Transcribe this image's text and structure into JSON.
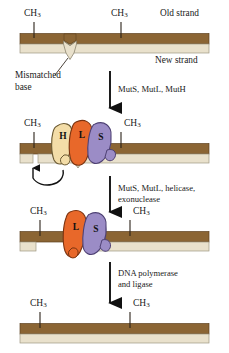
{
  "figure": {
    "methyl_label": "CH",
    "methyl_sub": "3"
  },
  "colors": {
    "old_strand": "#8B6534",
    "old_strand_dark": "#6E4B22",
    "new_strand": "#E9E1CC",
    "new_strand_edge": "#BBB49C",
    "mutH": "#F3DDA8",
    "mutL": "#E8682A",
    "mutS": "#9B8CC6",
    "outline": "#3A2E1E",
    "arrow": "#111111",
    "text": "#1A1A1A"
  },
  "panels": [
    {
      "id": "panel-1-mismatch",
      "methyl_marks": 2,
      "annotations": {
        "old_strand": "Old strand",
        "new_strand": "New strand",
        "mismatch_line1": "Mismatched",
        "mismatch_line2": "base"
      }
    },
    {
      "id": "panel-2-recognition",
      "methyl_marks": 2,
      "proteins": [
        {
          "name": "MutH",
          "letter": "H",
          "color": "#F3DDA8"
        },
        {
          "name": "MutL",
          "letter": "L",
          "color": "#E8682A"
        },
        {
          "name": "MutS",
          "letter": "S",
          "color": "#9B8CC6"
        }
      ],
      "annotations": {
        "nick": ""
      }
    },
    {
      "id": "panel-3-excision",
      "methyl_marks": 2,
      "proteins": [
        {
          "name": "MutL",
          "letter": "L",
          "color": "#E8682A"
        },
        {
          "name": "MutS",
          "letter": "S",
          "color": "#9B8CC6"
        }
      ]
    },
    {
      "id": "panel-4-repaired",
      "methyl_marks": 2
    }
  ],
  "steps": [
    {
      "id": "step-1",
      "line1": "MutS, MutL, MutH",
      "line2": ""
    },
    {
      "id": "step-2",
      "line1": "MutS, MutL, helicase,",
      "line2": "exonuclease"
    },
    {
      "id": "step-3",
      "line1": "DNA polymerase",
      "line2": "and ligase"
    }
  ]
}
